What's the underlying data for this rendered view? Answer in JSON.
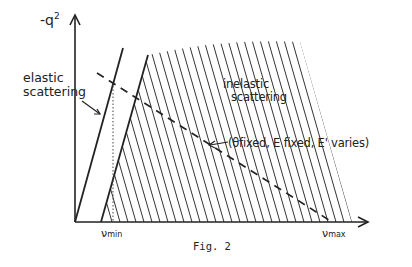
{
  "figure": {
    "caption": "Fig. 2",
    "y_axis_label": "-q",
    "y_axis_label_sup": "2",
    "x_axis_ticks": {
      "nu_min": {
        "symbol": "ν",
        "sub": "min"
      },
      "nu_max": {
        "symbol": "ν",
        "sub": "max"
      }
    },
    "regions": {
      "elastic": {
        "line1": "elastic",
        "line2": "scattering"
      },
      "inelastic": {
        "line1": "inelastic",
        "line2": "scattering"
      }
    },
    "annotation": "(θfixed, E fixed, E' varies)",
    "colors": {
      "ink": "#222222",
      "background": "#ffffff"
    }
  }
}
